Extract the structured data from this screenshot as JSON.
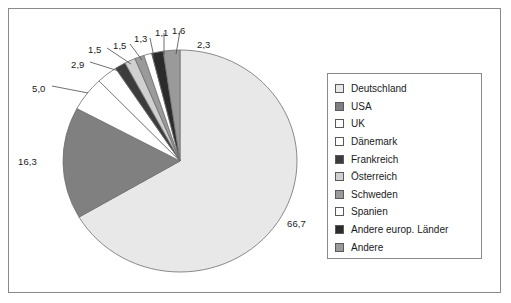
{
  "chart_data": {
    "type": "pie",
    "title": "",
    "subtitle": "",
    "xlabel": "",
    "ylabel": "",
    "legend_position": "right",
    "grid": false,
    "value_format": "de-DE decimal comma, one decimal place",
    "unit": "%",
    "total": 100.0,
    "start_angle_deg": 0,
    "direction": "clockwise",
    "categories": [
      "Deutschland",
      "USA",
      "UK",
      "Dänemark",
      "Frankreich",
      "Österreich",
      "Schweden",
      "Spanien",
      "Andere europ. Länder",
      "Andere"
    ],
    "values": [
      66.7,
      16.3,
      5.0,
      2.9,
      1.5,
      1.5,
      1.3,
      1.1,
      1.6,
      2.3
    ],
    "value_labels": [
      "66,7",
      "16,3",
      "5,0",
      "2,9",
      "1,5",
      "1,5",
      "1,3",
      "1,1",
      "1,6",
      "2,3"
    ],
    "colors": [
      "#e8e8e8",
      "#808080",
      "#ffffff",
      "#ffffff",
      "#3c3c3c",
      "#d0d0d0",
      "#9a9a9a",
      "#ffffff",
      "#2b2b2b",
      "#9a9a9a"
    ],
    "slices": [
      {
        "label": "Deutschland",
        "value": 66.7,
        "value_label": "66,7",
        "color": "#e8e8e8"
      },
      {
        "label": "USA",
        "value": 16.3,
        "value_label": "16,3",
        "color": "#808080"
      },
      {
        "label": "UK",
        "value": 5.0,
        "value_label": "5,0",
        "color": "#ffffff"
      },
      {
        "label": "Dänemark",
        "value": 2.9,
        "value_label": "2,9",
        "color": "#ffffff"
      },
      {
        "label": "Frankreich",
        "value": 1.5,
        "value_label": "1,5",
        "color": "#3c3c3c"
      },
      {
        "label": "Österreich",
        "value": 1.5,
        "value_label": "1,5",
        "color": "#d0d0d0"
      },
      {
        "label": "Schweden",
        "value": 1.3,
        "value_label": "1,3",
        "color": "#9a9a9a"
      },
      {
        "label": "Spanien",
        "value": 1.1,
        "value_label": "1,1",
        "color": "#ffffff"
      },
      {
        "label": "Andere europ. Länder",
        "value": 1.6,
        "value_label": "1,6",
        "color": "#2b2b2b"
      },
      {
        "label": "Andere",
        "value": 2.3,
        "value_label": "2,3",
        "color": "#9a9a9a"
      }
    ]
  },
  "legend": {
    "items": [
      {
        "label": "Deutschland",
        "color": "#e8e8e8"
      },
      {
        "label": "USA",
        "color": "#808080"
      },
      {
        "label": "UK",
        "color": "#ffffff"
      },
      {
        "label": "Dänemark",
        "color": "#ffffff"
      },
      {
        "label": "Frankreich",
        "color": "#3c3c3c"
      },
      {
        "label": "Österreich",
        "color": "#d0d0d0"
      },
      {
        "label": "Schweden",
        "color": "#9a9a9a"
      },
      {
        "label": "Spanien",
        "color": "#ffffff"
      },
      {
        "label": "Andere europ. Länder",
        "color": "#2b2b2b"
      },
      {
        "label": "Andere",
        "color": "#9a9a9a"
      }
    ]
  },
  "style": {
    "frame_border_color": "#8a8a8a",
    "slice_outline_color": "#6f6f6f",
    "background": "#ffffff",
    "text_color": "#1a1a1a"
  }
}
